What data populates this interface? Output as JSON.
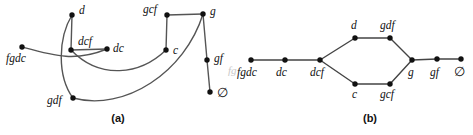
{
  "figure": {
    "background_color": "#ffffff",
    "node_color": "#111111",
    "edge_color": "#555555",
    "width": 473,
    "height": 135
  },
  "panels": [
    {
      "id": "a",
      "caption": "(a)",
      "caption_x": 118,
      "caption_y": 122,
      "nodes": [
        {
          "id": "fgdc",
          "label": "fgdc",
          "x": 22,
          "y": 47,
          "label_x": 6,
          "label_y": 62,
          "anchor": "start"
        },
        {
          "id": "d",
          "label": "d",
          "x": 72,
          "y": 15,
          "label_x": 79,
          "label_y": 14,
          "anchor": "start"
        },
        {
          "id": "dcf",
          "label": "dcf",
          "x": 71,
          "y": 50,
          "label_x": 78,
          "label_y": 45,
          "anchor": "start"
        },
        {
          "id": "dc",
          "label": "dc",
          "x": 107,
          "y": 49,
          "label_x": 113,
          "label_y": 52,
          "anchor": "start"
        },
        {
          "id": "gdf",
          "label": "gdf",
          "x": 73,
          "y": 98,
          "label_x": 47,
          "label_y": 104,
          "anchor": "start"
        },
        {
          "id": "gcf",
          "label": "gcf",
          "x": 167,
          "y": 15,
          "label_x": 143,
          "label_y": 13,
          "anchor": "start"
        },
        {
          "id": "g",
          "label": "g",
          "x": 203,
          "y": 14,
          "label_x": 210,
          "label_y": 15,
          "anchor": "start"
        },
        {
          "id": "c",
          "label": "c",
          "x": 166,
          "y": 50,
          "label_x": 173,
          "label_y": 54,
          "anchor": "start"
        },
        {
          "id": "gf",
          "label": "gf",
          "x": 207,
          "y": 60,
          "label_x": 214,
          "label_y": 62,
          "anchor": "start"
        },
        {
          "id": "empty",
          "label": "∅",
          "x": 210,
          "y": 92,
          "label_x": 217,
          "label_y": 97,
          "anchor": "start"
        }
      ],
      "edges": [
        {
          "from": "d",
          "to": "dcf",
          "kind": "straight",
          "path": "M 72 15 L 71 50"
        },
        {
          "from": "dcf",
          "to": "dc",
          "kind": "straight",
          "path": "M 71 50 L 107 49"
        },
        {
          "from": "gcf",
          "to": "g",
          "kind": "straight",
          "path": "M 167 15 L 203 14"
        },
        {
          "from": "gcf",
          "to": "c",
          "kind": "straight",
          "path": "M 167 15 L 166 50"
        },
        {
          "from": "g",
          "to": "gf",
          "kind": "straight",
          "path": "M 203 14 L 207 60"
        },
        {
          "from": "gf",
          "to": "empty",
          "kind": "straight",
          "path": "M 207 60 L 210 92"
        },
        {
          "from": "fgdc",
          "to": "dc",
          "kind": "curved",
          "path": "M 22 47 C 55 56 75 62 107 49"
        },
        {
          "from": "d",
          "to": "gdf",
          "kind": "curved",
          "path": "M 72 15 C 58 38 57 76 73 98"
        },
        {
          "from": "dcf",
          "to": "c",
          "kind": "curved",
          "path": "M 71 50 C 100 80 140 75 166 50"
        },
        {
          "from": "gdf",
          "to": "g",
          "kind": "curved",
          "path": "M 73 98 C 125 112 185 72 203 14"
        }
      ]
    },
    {
      "id": "b",
      "caption": "(b)",
      "caption_x": 370,
      "caption_y": 122,
      "nodes": [
        {
          "id": "fgdc",
          "label": "fgdc",
          "x": 251,
          "y": 60,
          "label_x": 237,
          "label_y": 76,
          "anchor": "start"
        },
        {
          "id": "dc",
          "label": "dc",
          "x": 285,
          "y": 60,
          "label_x": 276,
          "label_y": 76,
          "anchor": "start"
        },
        {
          "id": "dcf",
          "label": "dcf",
          "x": 320,
          "y": 60,
          "label_x": 310,
          "label_y": 76,
          "anchor": "start"
        },
        {
          "id": "d",
          "label": "d",
          "x": 355,
          "y": 38,
          "label_x": 351,
          "label_y": 29,
          "anchor": "start"
        },
        {
          "id": "gdf",
          "label": "gdf",
          "x": 390,
          "y": 38,
          "label_x": 380,
          "label_y": 29,
          "anchor": "start"
        },
        {
          "id": "c",
          "label": "c",
          "x": 355,
          "y": 84,
          "label_x": 352,
          "label_y": 98,
          "anchor": "start"
        },
        {
          "id": "gcf",
          "label": "gcf",
          "x": 390,
          "y": 84,
          "label_x": 380,
          "label_y": 98,
          "anchor": "start"
        },
        {
          "id": "g",
          "label": "g",
          "x": 412,
          "y": 60,
          "label_x": 408,
          "label_y": 76,
          "anchor": "start"
        },
        {
          "id": "gf",
          "label": "gf",
          "x": 437,
          "y": 59,
          "label_x": 430,
          "label_y": 76,
          "anchor": "start"
        },
        {
          "id": "empty",
          "label": "∅",
          "x": 461,
          "y": 59,
          "label_x": 454,
          "label_y": 76,
          "anchor": "start"
        }
      ],
      "edges": [
        {
          "from": "fgdc",
          "to": "dc",
          "kind": "straight",
          "path": "M 251 60 L 285 60"
        },
        {
          "from": "dc",
          "to": "dcf",
          "kind": "straight",
          "path": "M 285 60 L 320 60"
        },
        {
          "from": "dcf",
          "to": "d",
          "kind": "straight",
          "path": "M 320 60 L 355 38"
        },
        {
          "from": "dcf",
          "to": "c",
          "kind": "straight",
          "path": "M 320 60 L 355 84"
        },
        {
          "from": "d",
          "to": "gdf",
          "kind": "straight",
          "path": "M 355 38 L 390 38"
        },
        {
          "from": "c",
          "to": "gcf",
          "kind": "straight",
          "path": "M 355 84 L 390 84"
        },
        {
          "from": "gdf",
          "to": "g",
          "kind": "straight",
          "path": "M 390 38 L 412 60"
        },
        {
          "from": "gcf",
          "to": "g",
          "kind": "straight",
          "path": "M 390 84 L 412 60"
        },
        {
          "from": "g",
          "to": "gf",
          "kind": "straight",
          "path": "M 412 60 L 437 59"
        },
        {
          "from": "gf",
          "to": "empty",
          "kind": "straight",
          "path": "M 437 59 L 461 59"
        }
      ]
    }
  ],
  "artifacts": [
    {
      "id": "bleed-fg",
      "label": "fg",
      "x": 228,
      "y": 74
    }
  ]
}
